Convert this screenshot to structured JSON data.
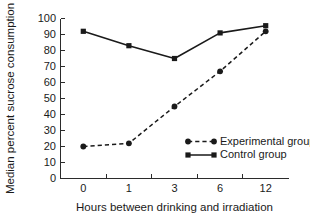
{
  "chart_data": {
    "type": "line",
    "title": "",
    "xlabel": "Hours between drinking and irradiation",
    "ylabel": "Median percent sucrose consumption",
    "categories": [
      "0",
      "1",
      "3",
      "6",
      "12"
    ],
    "ylim": [
      0,
      100
    ],
    "ytick_step": 10,
    "yticks": [
      "100",
      "90",
      "80",
      "70",
      "60",
      "50",
      "40",
      "30",
      "20",
      "10",
      "0"
    ],
    "grid": false,
    "legend_position": "inside lower-right",
    "series": [
      {
        "name": "Experimental group",
        "values": [
          20,
          22,
          45,
          67,
          92
        ],
        "linestyle": "dashed",
        "marker": "circle",
        "color": "#1a1a1a"
      },
      {
        "name": "Control group",
        "values": [
          92,
          83,
          75,
          91,
          95.5
        ],
        "linestyle": "solid",
        "marker": "square",
        "color": "#1a1a1a"
      }
    ]
  },
  "figure": {
    "background_color": "#ffffff",
    "ink_color": "#1a1a1a"
  }
}
